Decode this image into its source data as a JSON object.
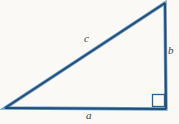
{
  "figure": {
    "name": "right-triangle",
    "background_color": "#faf9f6",
    "stroke_color": "#1f4e79",
    "stroke_highlight_color": "#5b8db8",
    "label_color": "#3b3b3b",
    "width": 179,
    "height": 124
  },
  "labels": {
    "hypotenuse": "c",
    "vertical_leg": "b",
    "horizontal_leg": "a"
  },
  "chart_data": {
    "type": "diagram",
    "title": "",
    "shape": "right triangle",
    "vertices": [
      {
        "name": "bottom-left",
        "x": 5,
        "y": 108
      },
      {
        "name": "bottom-right",
        "x": 166,
        "y": 109
      },
      {
        "name": "top-right",
        "x": 165,
        "y": 3
      }
    ],
    "sides": [
      {
        "name": "a",
        "label": "a",
        "from": "bottom-left",
        "to": "bottom-right",
        "role": "horizontal leg (base)"
      },
      {
        "name": "b",
        "label": "b",
        "from": "bottom-right",
        "to": "top-right",
        "role": "vertical leg"
      },
      {
        "name": "c",
        "label": "c",
        "from": "top-right",
        "to": "bottom-left",
        "role": "hypotenuse"
      }
    ],
    "angles": [
      {
        "at": "bottom-right",
        "measure_degrees": 90,
        "marker": "square"
      }
    ],
    "grid": false,
    "legend": null
  }
}
